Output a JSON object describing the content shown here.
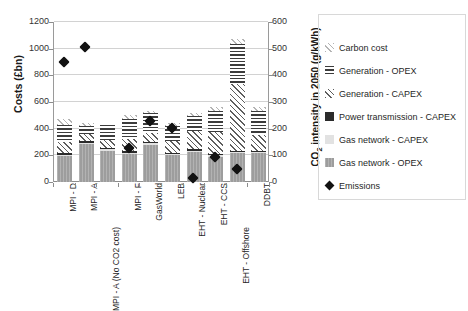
{
  "chart_data": {
    "type": "bar",
    "title": "",
    "subtitle": "",
    "ylabel": "Costs (£bn)",
    "ylabel_right": "CO2 intensity in 2050 (g/kWh)",
    "xlabel": "",
    "ylim": [
      0,
      1200
    ],
    "ylim_right": [
      0,
      600
    ],
    "yticks": [
      0,
      200,
      400,
      600,
      800,
      1000,
      1200
    ],
    "yticks_right": [
      0,
      100,
      200,
      300,
      400,
      500,
      600
    ],
    "grid": true,
    "legend_position": "right",
    "categories": [
      "MPI - D",
      "MPI - A",
      "MPI - A (No CO2 cost)",
      "MPI - F",
      "GasWorld",
      "LEB",
      "EHT - Nuclear",
      "EHT - CCS",
      "EHT - Offshore",
      "DDBT"
    ],
    "series": [
      {
        "name": "Gas network - OPEX",
        "pattern": "solid-grey",
        "values": [
          195,
          285,
          235,
          210,
          280,
          200,
          225,
          190,
          215,
          215
        ]
      },
      {
        "name": "Gas network - CAPEX",
        "pattern": "light-solid",
        "values": [
          10,
          10,
          10,
          10,
          10,
          10,
          10,
          10,
          10,
          10
        ]
      },
      {
        "name": "Power transmission - CAPEX",
        "pattern": "black-solid",
        "values": [
          10,
          10,
          10,
          10,
          10,
          10,
          10,
          10,
          10,
          10
        ]
      },
      {
        "name": "Generation - CAPEX",
        "pattern": "diagonal-hatch",
        "values": [
          85,
          55,
          60,
          95,
          70,
          85,
          140,
          165,
          500,
          115
        ]
      },
      {
        "name": "Generation - OPEX",
        "pattern": "horizontal-hatch",
        "values": [
          130,
          60,
          110,
          150,
          145,
          115,
          110,
          155,
          300,
          180
        ]
      },
      {
        "name": "Carbon cost",
        "pattern": "light-diagonal",
        "values": [
          45,
          25,
          0,
          30,
          20,
          20,
          25,
          30,
          40,
          35
        ]
      }
    ],
    "totals": [
      475,
      445,
      425,
      505,
      535,
      440,
      520,
      560,
      1075,
      565
    ],
    "markers": {
      "name": "Emissions",
      "axis": "right",
      "unit": "g/kWh",
      "values_right_axis": [
        465,
        523,
        0,
        142,
        244,
        218,
        30,
        108,
        62,
        0
      ],
      "values_left_axis": [
        930,
        1045,
        0,
        283,
        488,
        435,
        60,
        215,
        125,
        0
      ],
      "present": [
        true,
        true,
        false,
        true,
        true,
        true,
        true,
        true,
        true,
        false
      ]
    }
  },
  "legend": {
    "items": [
      {
        "label": "Carbon cost",
        "swatch": "light-diagonal-swatch"
      },
      {
        "label": "Generation - OPEX",
        "swatch": "horizontal-hatch-swatch"
      },
      {
        "label": "Generation - CAPEX",
        "swatch": "diagonal-hatch-swatch"
      },
      {
        "label": "Power transmission - CAPEX",
        "swatch": "black-solid-swatch"
      },
      {
        "label": "Gas network - CAPEX",
        "swatch": "light-solid-swatch"
      },
      {
        "label": "Gas network - OPEX",
        "swatch": "grey-solid-swatch"
      },
      {
        "label": "Emissions",
        "swatch": "black-diamond-marker"
      }
    ]
  }
}
